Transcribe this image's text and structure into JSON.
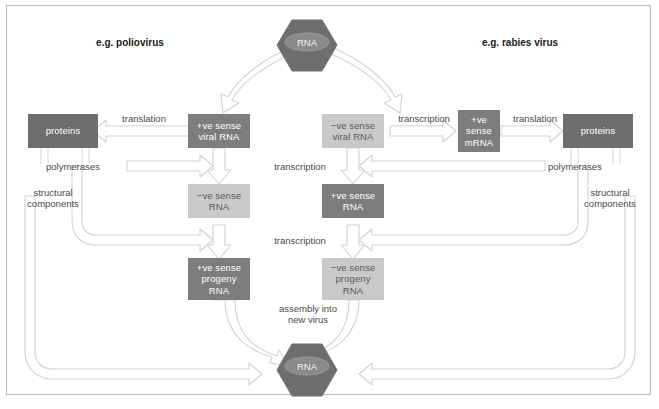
{
  "figure": {
    "title_left": "e.g. poliovirus",
    "title_right": "e.g. rabies virus",
    "background": "#ffffff",
    "frame_color": "#b9b9b9",
    "dark_fill": "#7d7d7d",
    "light_fill": "#c9c9c9",
    "hexagon_fill": "#6e6e6e",
    "arrow_stroke": "#cfcfcf"
  },
  "nodes": {
    "virion_top": "RNA",
    "virion_bottom": "RNA",
    "left": {
      "proteins": "proteins",
      "viral_rna": "+ve sense\nviral RNA",
      "viral_rna_l1": "+ve sense",
      "viral_rna_l2": "viral RNA",
      "template_rna_l1": "−ve sense",
      "template_rna_l2": "RNA",
      "progeny_l1": "+ve sense",
      "progeny_l2": "progeny",
      "progeny_l3": "RNA"
    },
    "right": {
      "proteins": "proteins",
      "viral_rna_l1": "−ve sense",
      "viral_rna_l2": "viral RNA",
      "mrna_l1": "+ve",
      "mrna_l2": "sense",
      "mrna_l3": "mRNA",
      "template_rna_l1": "+ve sense",
      "template_rna_l2": "RNA",
      "progeny_l1": "−ve sense",
      "progeny_l2": "progeny",
      "progeny_l3": "RNA"
    }
  },
  "edge_labels": {
    "translation_left": "translation",
    "translation_right": "translation",
    "transcription_right_top": "transcription",
    "transcription_mid_1": "transcription",
    "transcription_mid_2": "transcription",
    "polymerases_left": "polymerases",
    "polymerases_right": "polymerases",
    "structural_left_l1": "structural",
    "structural_left_l2": "components",
    "structural_right_l1": "structural",
    "structural_right_l2": "components",
    "assembly_l1": "assembly into",
    "assembly_l2": "new virus"
  }
}
